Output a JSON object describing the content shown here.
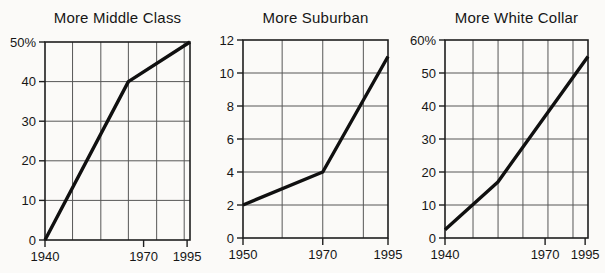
{
  "figure": {
    "background": "#fbfaf8",
    "colors": {
      "line": "#101010",
      "grid": "#575757",
      "axis": "#1e1e1e",
      "text": "#161616"
    }
  },
  "chart_data": [
    {
      "type": "line",
      "title": "More Middle Class",
      "x": [
        1940,
        1970,
        1995
      ],
      "values": [
        0,
        40,
        50
      ],
      "ylim": [
        0,
        50
      ],
      "y_tick_values": [
        0,
        10,
        20,
        30,
        40,
        50
      ],
      "y_tick_labels": [
        "0",
        "10",
        "20",
        "30",
        "40",
        "50%"
      ],
      "x_tick_labels": [
        "1940",
        "1970",
        "1995"
      ],
      "x_tick_fractions": [
        0,
        0.68,
        0.98
      ],
      "point_x_fractions": [
        0,
        0.575,
        1
      ],
      "grid_x_fractions": [
        0.19,
        0.385,
        0.575,
        0.77,
        0.96
      ],
      "grid": "on",
      "legend": "none"
    },
    {
      "type": "line",
      "title": "More Suburban",
      "x": [
        1950,
        1970,
        1995
      ],
      "values": [
        2,
        4,
        11
      ],
      "ylim": [
        0,
        12
      ],
      "y_tick_values": [
        0,
        2,
        4,
        6,
        8,
        10,
        12
      ],
      "y_tick_labels": [
        "0",
        "2",
        "4",
        "6",
        "8",
        "10",
        "12"
      ],
      "x_tick_labels": [
        "1950",
        "1970",
        "1995"
      ],
      "x_tick_fractions": [
        0,
        0.55,
        1
      ],
      "point_x_fractions": [
        0,
        0.55,
        1
      ],
      "grid_x_fractions": [
        0.27,
        0.55,
        0.83
      ],
      "grid": "on",
      "legend": "none"
    },
    {
      "type": "line",
      "title": "More White Collar",
      "x": [
        1940,
        1960,
        1995
      ],
      "values": [
        2.5,
        17,
        55
      ],
      "ylim": [
        0,
        60
      ],
      "y_tick_values": [
        0,
        10,
        20,
        30,
        40,
        50,
        60
      ],
      "y_tick_labels": [
        "0",
        "10",
        "20",
        "30",
        "40",
        "50",
        "60%"
      ],
      "x_tick_labels": [
        "1940",
        "1970",
        "1995"
      ],
      "x_tick_fractions": [
        0,
        0.7,
        0.98
      ],
      "point_x_fractions": [
        0,
        0.37,
        1
      ],
      "grid_x_fractions": [
        0.196,
        0.371,
        0.545,
        0.72,
        0.895
      ],
      "grid": "on",
      "legend": "none"
    }
  ]
}
